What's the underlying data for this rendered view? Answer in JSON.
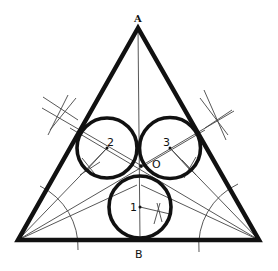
{
  "diagram": {
    "labels": {
      "apex": "A",
      "base_mid": "B",
      "center": "O",
      "circle1": "1",
      "circle2": "2",
      "circle3": "3"
    },
    "colors": {
      "stroke": "#111111",
      "construction": "#444444",
      "background": "#ffffff"
    }
  }
}
